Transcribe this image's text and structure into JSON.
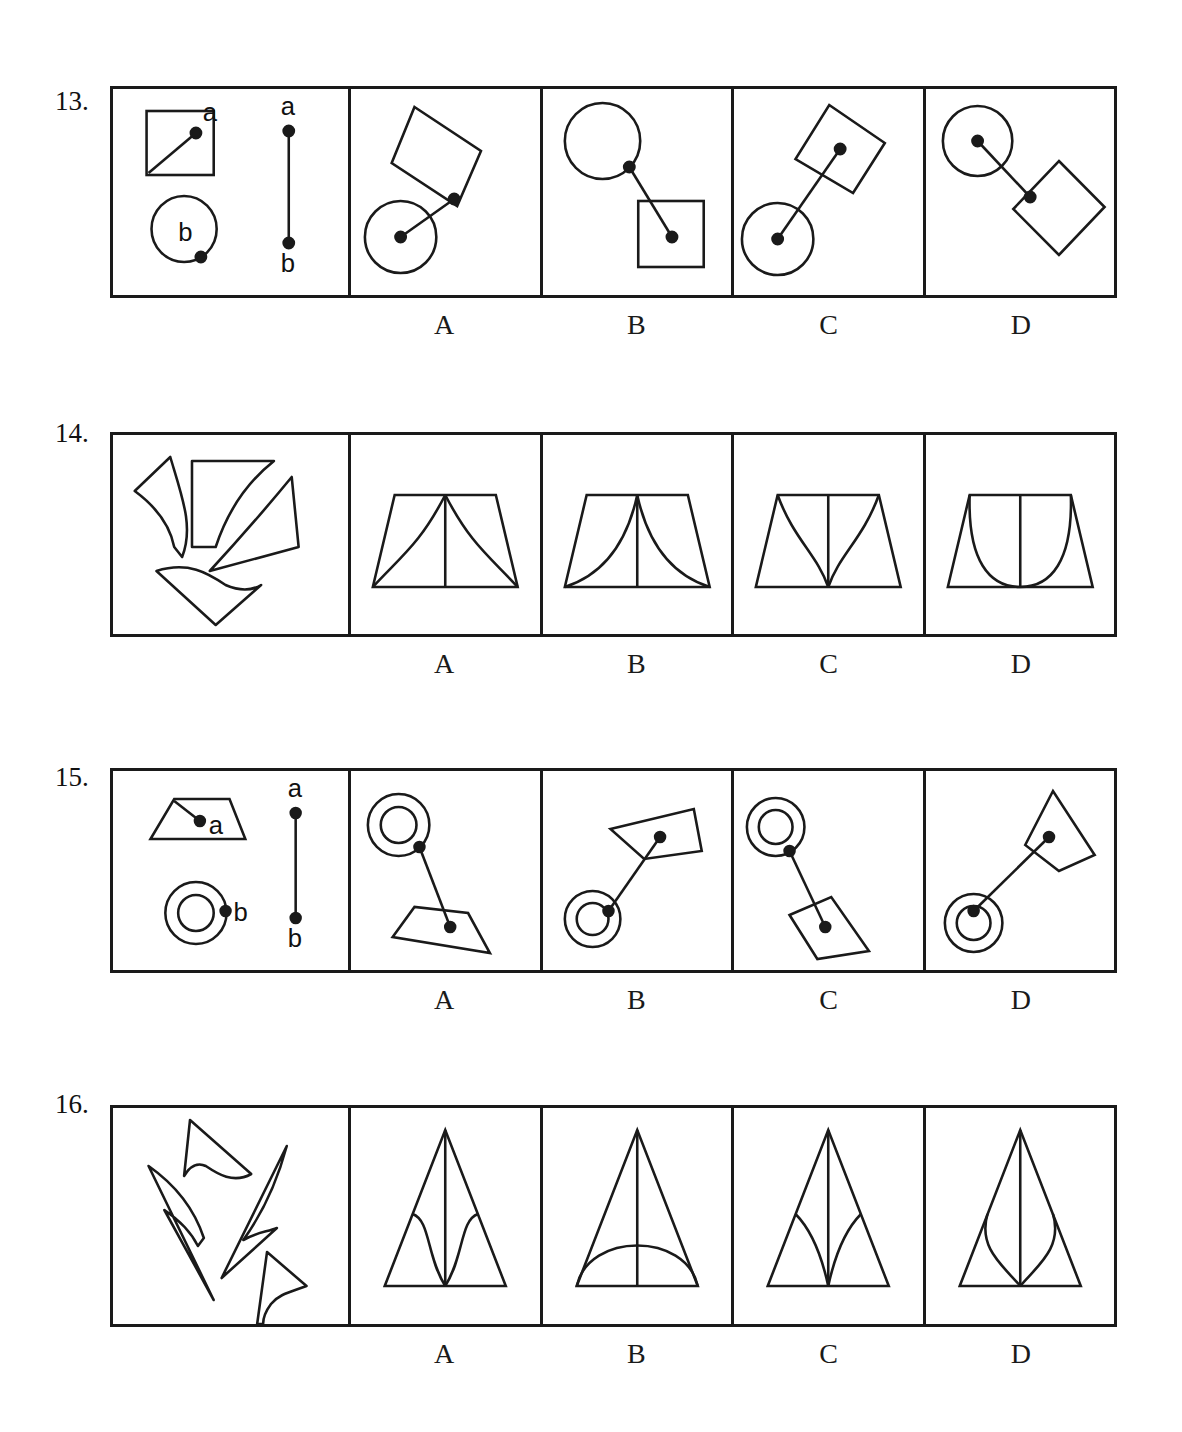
{
  "page": {
    "background": "#ffffff",
    "ink": "#1a1a1a",
    "width": 1182,
    "height": 1432
  },
  "option_letters": [
    "A",
    "B",
    "C",
    "D"
  ],
  "questions": [
    {
      "number": "13.",
      "top": 86,
      "strip_height": 212,
      "letters_top": 305,
      "stem": {
        "type": "distance-and-shape",
        "shapes": [
          {
            "name": "square",
            "point_label": "a"
          },
          {
            "name": "circle",
            "point_label": "b"
          }
        ],
        "reference_segment": {
          "top_label": "a",
          "bottom_label": "b"
        }
      },
      "options": [
        {
          "letter": "A",
          "shapes": [
            "circle",
            "tilted-square"
          ]
        },
        {
          "letter": "B",
          "shapes": [
            "circle",
            "square"
          ]
        },
        {
          "letter": "C",
          "shapes": [
            "circle",
            "tilted-square"
          ]
        },
        {
          "letter": "D",
          "shapes": [
            "circle",
            "tilted-square"
          ]
        }
      ]
    },
    {
      "number": "14.",
      "top": 432,
      "strip_height": 205,
      "letters_top": 648,
      "stem": {
        "type": "scattered-pieces",
        "piece_count": 4
      },
      "options": [
        {
          "letter": "A",
          "figure": "trapezoid-with-concave-wings"
        },
        {
          "letter": "B",
          "figure": "trapezoid-with-s-curves"
        },
        {
          "letter": "C",
          "figure": "trapezoid-with-narrow-spike"
        },
        {
          "letter": "D",
          "figure": "trapezoid-with-u-curve"
        }
      ]
    },
    {
      "number": "15.",
      "top": 768,
      "strip_height": 205,
      "letters_top": 983,
      "stem": {
        "type": "distance-and-shape",
        "shapes": [
          {
            "name": "trapezoid",
            "point_label": "a"
          },
          {
            "name": "concentric-circles",
            "point_label": "b"
          }
        ],
        "reference_segment": {
          "top_label": "a",
          "bottom_label": "b"
        }
      },
      "options": [
        {
          "letter": "A",
          "shapes": [
            "concentric-circles",
            "quadrilateral"
          ]
        },
        {
          "letter": "B",
          "shapes": [
            "quadrilateral",
            "concentric-circles"
          ]
        },
        {
          "letter": "C",
          "shapes": [
            "concentric-circles",
            "quadrilateral"
          ]
        },
        {
          "letter": "D",
          "shapes": [
            "quadrilateral",
            "concentric-circles"
          ]
        }
      ]
    },
    {
      "number": "16.",
      "top": 1105,
      "strip_height": 222,
      "letters_top": 1335,
      "stem": {
        "type": "scattered-pieces",
        "piece_count": 4
      },
      "options": [
        {
          "letter": "A",
          "figure": "triangle-with-narrow-leaf"
        },
        {
          "letter": "B",
          "figure": "triangle-with-arch"
        },
        {
          "letter": "C",
          "figure": "triangle-with-twin-curves"
        },
        {
          "letter": "D",
          "figure": "triangle-with-wide-leaf"
        }
      ]
    }
  ]
}
